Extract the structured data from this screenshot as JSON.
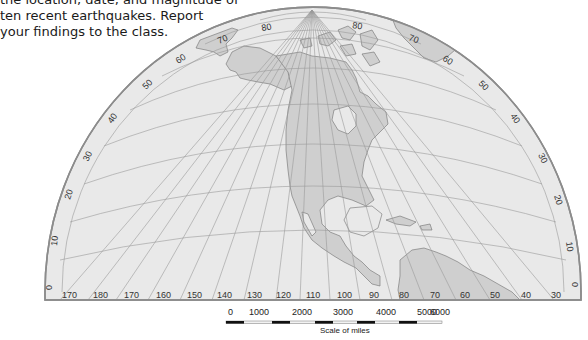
{
  "intro_text": {
    "lines": [
      "the location, date, and magnitude of",
      "ten recent earthquakes. Report",
      "your findings to the class."
    ]
  },
  "map": {
    "projection": "hemispheric half-ellipse",
    "colors": {
      "ocean": "#e9e9e9",
      "land": "#cfcfcf",
      "land_dark": "#c4c4c4",
      "graticule": "#9a9a9a",
      "outline": "#8c8c8c",
      "coast": "#6f6f6f"
    },
    "latitude_labels_left": [
      "0",
      "10",
      "20",
      "30",
      "40",
      "50",
      "60",
      "70",
      "80"
    ],
    "latitude_labels_right": [
      "80",
      "70",
      "60",
      "50",
      "40",
      "30",
      "20",
      "10",
      "0"
    ],
    "longitude_labels": [
      "170",
      "180",
      "170",
      "160",
      "150",
      "140",
      "130",
      "120",
      "110",
      "100",
      "90",
      "80",
      "70",
      "60",
      "50",
      "40",
      "30"
    ]
  },
  "scale_bar": {
    "labels": [
      "0",
      "1000",
      "2000",
      "3000",
      "4000",
      "5000",
      "6000"
    ],
    "title": "Scale of miles"
  }
}
